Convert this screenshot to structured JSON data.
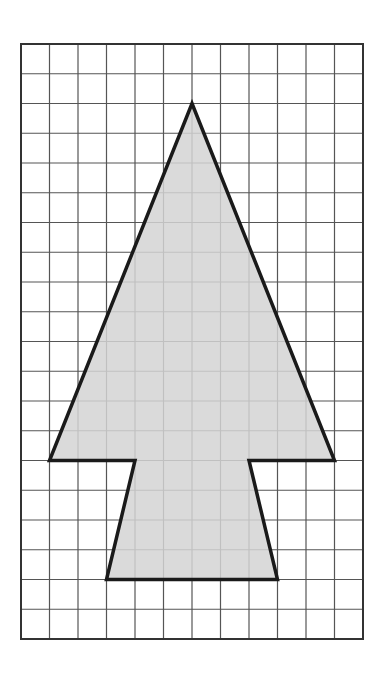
{
  "diagram": {
    "type": "grid-shape",
    "grid": {
      "columns": 12,
      "rows": 20,
      "left": 21,
      "top": 44,
      "right": 363,
      "bottom": 639,
      "line_color": "#555555",
      "border_color": "#333333"
    },
    "shape": {
      "fill": "#d4d4d4",
      "stroke": "#1a1a1a",
      "stroke_width": 3.5,
      "vertices_grid": [
        [
          6,
          2
        ],
        [
          11,
          14
        ],
        [
          8,
          14
        ],
        [
          9,
          18
        ],
        [
          3,
          18
        ],
        [
          4,
          14
        ],
        [
          1,
          14
        ]
      ]
    }
  }
}
